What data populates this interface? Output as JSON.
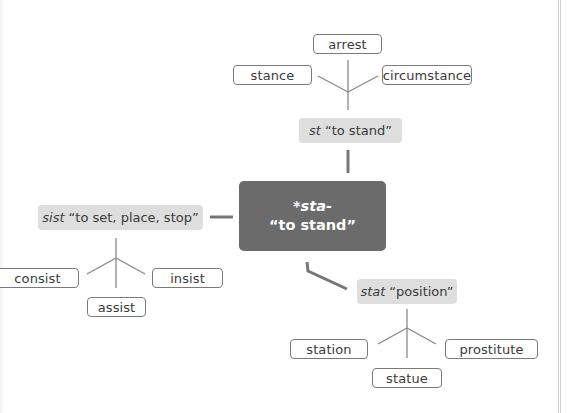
{
  "root": {
    "line1": "*sta-",
    "line2": "“to stand”",
    "fill_color": "#6b6b6b"
  },
  "stems": {
    "st": {
      "form": "st",
      "gloss": "“to stand”"
    },
    "sist": {
      "form": "sist",
      "gloss": "“to set, place, stop”"
    },
    "stat": {
      "form": "stat",
      "gloss": "“position”"
    }
  },
  "words": {
    "st": [
      "arrest",
      "stance",
      "circumstance"
    ],
    "sist": [
      "consist",
      "assist",
      "insist"
    ],
    "stat": [
      "station",
      "statue",
      "prostitute"
    ]
  },
  "colors": {
    "stem_fill": "#dedede",
    "word_border": "#7a7a7a",
    "connector": "#767676"
  }
}
